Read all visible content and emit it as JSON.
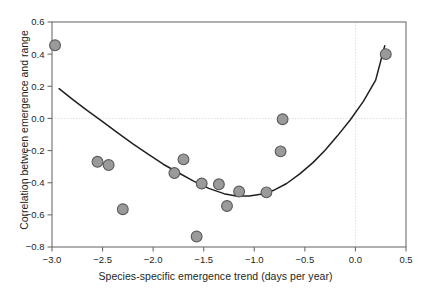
{
  "chart_data": {
    "type": "scatter",
    "title": "",
    "xlabel": "Species-specific emergence trend (days per year)",
    "ylabel": "Correlation between emergence and range",
    "xlim": [
      -3.0,
      0.5
    ],
    "ylim": [
      -0.8,
      0.6
    ],
    "xticks": [
      -3.0,
      -2.5,
      -2.0,
      -1.5,
      -1.0,
      -0.5,
      0.0,
      0.5
    ],
    "xticklabels": [
      "-3.0",
      "-2.5",
      "-2.0",
      "-1.5",
      "-1.0",
      "-0.5",
      "0.0",
      "0.5"
    ],
    "yticks": [
      0.6,
      0.4,
      0.2,
      0.0,
      -0.2,
      -0.4,
      -0.6,
      -0.8
    ],
    "yticklabels": [
      "0.6",
      "0.4",
      "0.2",
      "0.0",
      "-0.2",
      "-0.4",
      "-0.6",
      "-0.8"
    ],
    "grid": "reference-lines-at-x0-and-y0",
    "gridlines": {
      "x": [
        0.0
      ],
      "y": [
        0.0
      ]
    },
    "points": [
      {
        "x": -2.97,
        "y": 0.455
      },
      {
        "x": -2.55,
        "y": -0.27
      },
      {
        "x": -2.44,
        "y": -0.29
      },
      {
        "x": -2.3,
        "y": -0.565
      },
      {
        "x": -1.79,
        "y": -0.34
      },
      {
        "x": -1.7,
        "y": -0.255
      },
      {
        "x": -1.57,
        "y": -0.735
      },
      {
        "x": -1.52,
        "y": -0.405
      },
      {
        "x": -1.35,
        "y": -0.41
      },
      {
        "x": -1.27,
        "y": -0.545
      },
      {
        "x": -1.15,
        "y": -0.455
      },
      {
        "x": -0.88,
        "y": -0.46
      },
      {
        "x": -0.74,
        "y": -0.205
      },
      {
        "x": -0.72,
        "y": -0.005
      },
      {
        "x": 0.3,
        "y": 0.4
      }
    ],
    "fit_curve": {
      "kind": "quadratic",
      "note": "fitted parabola with minimum near x = -1.2",
      "points": [
        {
          "x": -2.93,
          "y": 0.185
        },
        {
          "x": -2.8,
          "y": 0.12
        },
        {
          "x": -2.65,
          "y": 0.048
        },
        {
          "x": -2.5,
          "y": -0.02
        },
        {
          "x": -2.35,
          "y": -0.09
        },
        {
          "x": -2.2,
          "y": -0.158
        },
        {
          "x": -2.05,
          "y": -0.222
        },
        {
          "x": -1.9,
          "y": -0.285
        },
        {
          "x": -1.75,
          "y": -0.338
        },
        {
          "x": -1.6,
          "y": -0.39
        },
        {
          "x": -1.45,
          "y": -0.435
        },
        {
          "x": -1.3,
          "y": -0.468
        },
        {
          "x": -1.18,
          "y": -0.482
        },
        {
          "x": -1.05,
          "y": -0.482
        },
        {
          "x": -0.92,
          "y": -0.47
        },
        {
          "x": -0.8,
          "y": -0.445
        },
        {
          "x": -0.68,
          "y": -0.405
        },
        {
          "x": -0.55,
          "y": -0.345
        },
        {
          "x": -0.42,
          "y": -0.275
        },
        {
          "x": -0.3,
          "y": -0.198
        },
        {
          "x": -0.18,
          "y": -0.11
        },
        {
          "x": -0.05,
          "y": -0.008
        },
        {
          "x": 0.08,
          "y": 0.108
        },
        {
          "x": 0.2,
          "y": 0.238
        },
        {
          "x": 0.29,
          "y": 0.452
        }
      ]
    },
    "style": {
      "point_fill": "#9a9a9a",
      "point_stroke": "#58595b",
      "curve_color": "#231f20",
      "axis_color": "#6d6e71",
      "gridline_color": "#e2e0e0",
      "text_color": "#231f20"
    }
  }
}
